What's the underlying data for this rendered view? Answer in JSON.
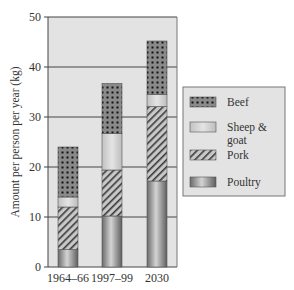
{
  "chart_data": {
    "type": "bar",
    "stacked": true,
    "title": "",
    "xlabel": "",
    "ylabel": "Amount per person per year (kg)",
    "ylim": [
      0,
      50
    ],
    "yticks": [
      0,
      10,
      20,
      30,
      40,
      50
    ],
    "grid": true,
    "legend_position": "right",
    "categories": [
      "1964–66",
      "1997–99",
      "2030"
    ],
    "series": [
      {
        "name": "Poultry",
        "pattern": "gradient",
        "values": [
          3.5,
          10.2,
          17.2
        ]
      },
      {
        "name": "Pork",
        "pattern": "hatch",
        "values": [
          8.5,
          9.2,
          14.9
        ]
      },
      {
        "name": "Sheep & goat",
        "pattern": "light",
        "values": [
          2.0,
          7.3,
          2.4
        ]
      },
      {
        "name": "Beef",
        "pattern": "dots",
        "values": [
          10.0,
          10.0,
          10.7
        ]
      }
    ],
    "legend": {
      "entries": [
        {
          "name": "Beef",
          "lines": [
            "Beef"
          ]
        },
        {
          "name": "Sheep & goat",
          "lines": [
            "Sheep &",
            "goat"
          ]
        },
        {
          "name": "Pork",
          "lines": [
            "Pork"
          ]
        },
        {
          "name": "Poultry",
          "lines": [
            "Poultry"
          ]
        }
      ]
    }
  }
}
